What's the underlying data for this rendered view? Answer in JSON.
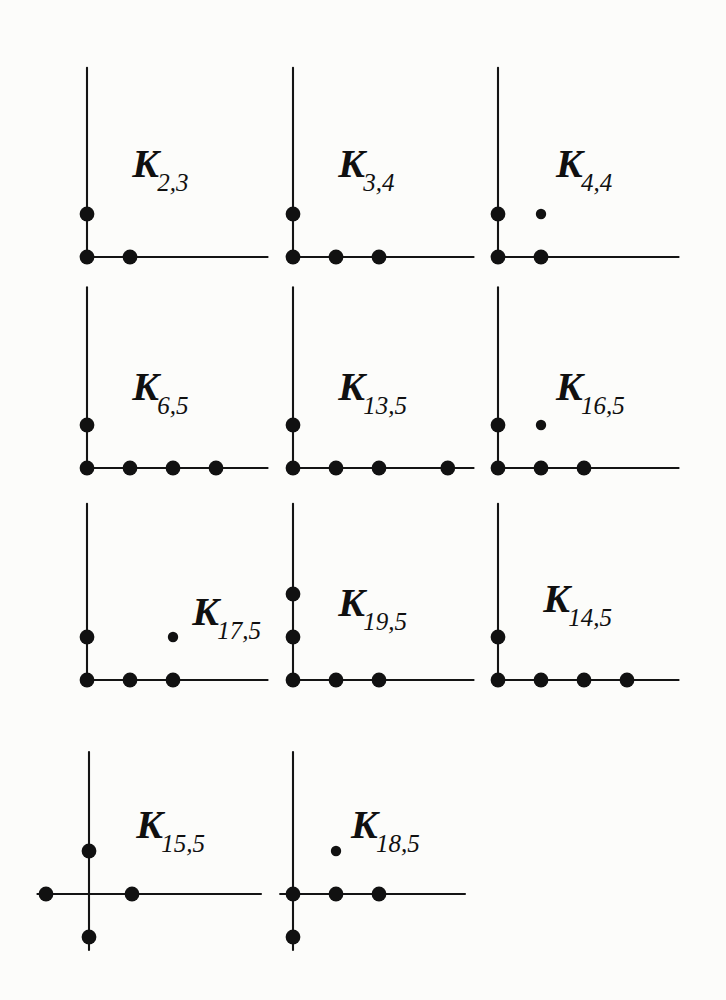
{
  "figure": {
    "title": "",
    "background_color": "#fcfcfa",
    "ink_color": "#111111",
    "grid": {
      "columns": 3,
      "rows": 4,
      "panel_count": 11
    }
  },
  "chart_data": {
    "type": "scatter",
    "title": "",
    "xlabel": "",
    "ylabel": "",
    "grid": false,
    "legend": "none",
    "unit_spacing_px": 43,
    "panels": [
      {
        "id": "K_2_3",
        "label_main": "K",
        "label_sub": "2,3",
        "row": 1,
        "col": 1,
        "origin_px": {
          "x": 87,
          "y": 257
        },
        "axes": {
          "x_min": 0,
          "x_max": 4.2,
          "y_min": 0,
          "y_max": 4.4
        },
        "points": [
          {
            "x": 0,
            "y": 0,
            "size": "large"
          },
          {
            "x": 1,
            "y": 0,
            "size": "large"
          },
          {
            "x": 0,
            "y": 1,
            "size": "large"
          }
        ]
      },
      {
        "id": "K_3_4",
        "label_main": "K",
        "label_sub": "3,4",
        "row": 1,
        "col": 2,
        "origin_px": {
          "x": 293,
          "y": 257
        },
        "axes": {
          "x_min": 0,
          "x_max": 4.2,
          "y_min": 0,
          "y_max": 4.4
        },
        "points": [
          {
            "x": 0,
            "y": 0,
            "size": "large"
          },
          {
            "x": 1,
            "y": 0,
            "size": "large"
          },
          {
            "x": 2,
            "y": 0,
            "size": "large"
          },
          {
            "x": 0,
            "y": 1,
            "size": "large"
          }
        ]
      },
      {
        "id": "K_4_4",
        "label_main": "K",
        "label_sub": "4,4",
        "row": 1,
        "col": 3,
        "origin_px": {
          "x": 498,
          "y": 257
        },
        "axes": {
          "x_min": 0,
          "x_max": 4.2,
          "y_min": 0,
          "y_max": 4.4
        },
        "points": [
          {
            "x": 0,
            "y": 0,
            "size": "large"
          },
          {
            "x": 1,
            "y": 0,
            "size": "large"
          },
          {
            "x": 0,
            "y": 1,
            "size": "large"
          },
          {
            "x": 1,
            "y": 1,
            "size": "small"
          }
        ]
      },
      {
        "id": "K_6_5",
        "label_main": "K",
        "label_sub": "6,5",
        "row": 2,
        "col": 1,
        "origin_px": {
          "x": 87,
          "y": 468
        },
        "axes": {
          "x_min": 0,
          "x_max": 4.2,
          "y_min": 0,
          "y_max": 4.2
        },
        "points": [
          {
            "x": 0,
            "y": 0,
            "size": "large"
          },
          {
            "x": 1,
            "y": 0,
            "size": "large"
          },
          {
            "x": 2,
            "y": 0,
            "size": "large"
          },
          {
            "x": 3,
            "y": 0,
            "size": "large"
          },
          {
            "x": 0,
            "y": 1,
            "size": "large"
          }
        ]
      },
      {
        "id": "K_13_5",
        "label_main": "K",
        "label_sub": "13,5",
        "row": 2,
        "col": 2,
        "origin_px": {
          "x": 293,
          "y": 468
        },
        "axes": {
          "x_min": 0,
          "x_max": 4.2,
          "y_min": 0,
          "y_max": 4.2
        },
        "points": [
          {
            "x": 0,
            "y": 0,
            "size": "large"
          },
          {
            "x": 1,
            "y": 0,
            "size": "large"
          },
          {
            "x": 2,
            "y": 0,
            "size": "large"
          },
          {
            "x": 3.6,
            "y": 0,
            "size": "large"
          },
          {
            "x": 0,
            "y": 1,
            "size": "large"
          }
        ]
      },
      {
        "id": "K_16_5",
        "label_main": "K",
        "label_sub": "16,5",
        "row": 2,
        "col": 3,
        "origin_px": {
          "x": 498,
          "y": 468
        },
        "axes": {
          "x_min": 0,
          "x_max": 4.2,
          "y_min": 0,
          "y_max": 4.2
        },
        "points": [
          {
            "x": 0,
            "y": 0,
            "size": "large"
          },
          {
            "x": 1,
            "y": 0,
            "size": "large"
          },
          {
            "x": 2,
            "y": 0,
            "size": "large"
          },
          {
            "x": 0,
            "y": 1,
            "size": "large"
          },
          {
            "x": 1,
            "y": 1,
            "size": "small"
          }
        ]
      },
      {
        "id": "K_17_5",
        "label_main": "K",
        "label_sub": "17,5",
        "row": 3,
        "col": 1,
        "origin_px": {
          "x": 87,
          "y": 680
        },
        "axes": {
          "x_min": 0,
          "x_max": 4.2,
          "y_min": 0,
          "y_max": 4.1
        },
        "points": [
          {
            "x": 0,
            "y": 0,
            "size": "large"
          },
          {
            "x": 1,
            "y": 0,
            "size": "large"
          },
          {
            "x": 2,
            "y": 0,
            "size": "large"
          },
          {
            "x": 0,
            "y": 1,
            "size": "large"
          },
          {
            "x": 2,
            "y": 1,
            "size": "small"
          }
        ]
      },
      {
        "id": "K_19_5",
        "label_main": "K",
        "label_sub": "19,5",
        "row": 3,
        "col": 2,
        "origin_px": {
          "x": 293,
          "y": 680
        },
        "axes": {
          "x_min": 0,
          "x_max": 4.2,
          "y_min": 0,
          "y_max": 4.1
        },
        "points": [
          {
            "x": 0,
            "y": 0,
            "size": "large"
          },
          {
            "x": 1,
            "y": 0,
            "size": "large"
          },
          {
            "x": 2,
            "y": 0,
            "size": "large"
          },
          {
            "x": 0,
            "y": 1,
            "size": "large"
          },
          {
            "x": 0,
            "y": 2,
            "size": "large"
          }
        ]
      },
      {
        "id": "K_14_5",
        "label_main": "K",
        "label_sub": "14,5",
        "row": 3,
        "col": 3,
        "origin_px": {
          "x": 498,
          "y": 680
        },
        "axes": {
          "x_min": 0,
          "x_max": 4.2,
          "y_min": 0,
          "y_max": 4.1
        },
        "points": [
          {
            "x": 0,
            "y": 0,
            "size": "large"
          },
          {
            "x": 1,
            "y": 0,
            "size": "large"
          },
          {
            "x": 2,
            "y": 0,
            "size": "large"
          },
          {
            "x": 3,
            "y": 0,
            "size": "large"
          },
          {
            "x": 0,
            "y": 1,
            "size": "large"
          }
        ]
      },
      {
        "id": "K_15_5",
        "label_main": "K",
        "label_sub": "15,5",
        "row": 4,
        "col": 1,
        "origin_px": {
          "x": 89,
          "y": 894
        },
        "axes": {
          "x_min": -1.2,
          "x_max": 4.0,
          "y_min": -1.3,
          "y_max": 3.3
        },
        "points": [
          {
            "x": -1,
            "y": 0,
            "size": "large"
          },
          {
            "x": 1,
            "y": 0,
            "size": "large"
          },
          {
            "x": 0,
            "y": 1,
            "size": "large"
          },
          {
            "x": 0,
            "y": -1,
            "size": "large"
          }
        ]
      },
      {
        "id": "K_18_5",
        "label_main": "K",
        "label_sub": "18,5",
        "row": 4,
        "col": 2,
        "origin_px": {
          "x": 293,
          "y": 894
        },
        "axes": {
          "x_min": -0.3,
          "x_max": 4.0,
          "y_min": -1.3,
          "y_max": 3.3
        },
        "points": [
          {
            "x": 0,
            "y": 0,
            "size": "large"
          },
          {
            "x": 1,
            "y": 0,
            "size": "large"
          },
          {
            "x": 2,
            "y": 0,
            "size": "large"
          },
          {
            "x": 0,
            "y": -1,
            "size": "large"
          },
          {
            "x": 1,
            "y": 1,
            "size": "small"
          }
        ]
      }
    ]
  }
}
